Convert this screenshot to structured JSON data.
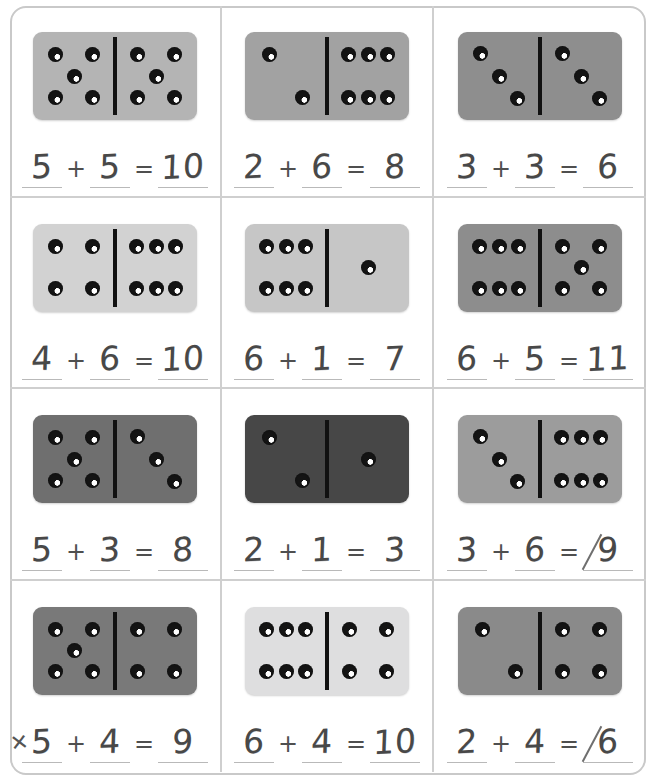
{
  "worksheet": {
    "title": "Domino Addition Worksheet",
    "columns": 3,
    "rows": 4,
    "frame_color": "#c9c9c9",
    "grid_line_color": "#cfcfcf",
    "pencil_color": "#484848",
    "pip_color": "#141414"
  },
  "problems": [
    {
      "id": "r1c1",
      "domino": {
        "left_pips": 5,
        "right_pips": 5,
        "tile_color": "#b4b4b4"
      },
      "equation": {
        "addend1": "5",
        "operator": "+",
        "addend2": "5",
        "equals": "=",
        "answer": "10"
      },
      "marks": {
        "crossed_out": "",
        "diagonal_slash": false,
        "answer_slash": false
      }
    },
    {
      "id": "r1c2",
      "domino": {
        "left_pips": 2,
        "right_pips": 6,
        "tile_color": "#a2a2a2"
      },
      "equation": {
        "addend1": "2",
        "operator": "+",
        "addend2": "6",
        "equals": "=",
        "answer": "8"
      },
      "marks": {
        "crossed_out": "",
        "diagonal_slash": false,
        "answer_slash": false
      }
    },
    {
      "id": "r1c3",
      "domino": {
        "left_pips": 3,
        "right_pips": 3,
        "tile_color": "#8e8e8e"
      },
      "equation": {
        "addend1": "3",
        "operator": "+",
        "addend2": "3",
        "equals": "=",
        "answer": "6"
      },
      "marks": {
        "crossed_out": "",
        "diagonal_slash": false,
        "answer_slash": false
      }
    },
    {
      "id": "r2c1",
      "domino": {
        "left_pips": 4,
        "right_pips": 6,
        "tile_color": "#d2d2d2"
      },
      "equation": {
        "addend1": "4",
        "operator": "+",
        "addend2": "6",
        "equals": "=",
        "answer": "10"
      },
      "marks": {
        "crossed_out": "",
        "diagonal_slash": false,
        "answer_slash": false
      }
    },
    {
      "id": "r2c2",
      "domino": {
        "left_pips": 6,
        "right_pips": 1,
        "tile_color": "#c6c6c6"
      },
      "equation": {
        "addend1": "6",
        "operator": "+",
        "addend2": "1",
        "equals": "=",
        "answer": "7"
      },
      "marks": {
        "crossed_out": "",
        "diagonal_slash": false,
        "answer_slash": false
      }
    },
    {
      "id": "r2c3",
      "domino": {
        "left_pips": 6,
        "right_pips": 5,
        "tile_color": "#8d8d8d"
      },
      "equation": {
        "addend1": "6",
        "operator": "+",
        "addend2": "5",
        "equals": "=",
        "answer": "11"
      },
      "marks": {
        "crossed_out": "",
        "diagonal_slash": false,
        "answer_slash": false
      }
    },
    {
      "id": "r3c1",
      "domino": {
        "left_pips": 5,
        "right_pips": 3,
        "tile_color": "#6f6f6f"
      },
      "equation": {
        "addend1": "5",
        "operator": "+",
        "addend2": "3",
        "equals": "=",
        "answer": "8"
      },
      "marks": {
        "crossed_out": "",
        "diagonal_slash": false,
        "answer_slash": false
      }
    },
    {
      "id": "r3c2",
      "domino": {
        "left_pips": 2,
        "right_pips": 1,
        "tile_color": "#474747"
      },
      "equation": {
        "addend1": "2",
        "operator": "+",
        "addend2": "1",
        "equals": "=",
        "answer": "3"
      },
      "marks": {
        "crossed_out": "",
        "diagonal_slash": false,
        "answer_slash": false
      }
    },
    {
      "id": "r3c3",
      "domino": {
        "left_pips": 3,
        "right_pips": 6,
        "tile_color": "#9c9c9c"
      },
      "equation": {
        "addend1": "3",
        "operator": "+",
        "addend2": "6",
        "equals": "=",
        "answer": "9"
      },
      "marks": {
        "crossed_out": "",
        "diagonal_slash": false,
        "answer_slash": true
      }
    },
    {
      "id": "r4c1",
      "domino": {
        "left_pips": 5,
        "right_pips": 4,
        "tile_color": "#797979"
      },
      "equation": {
        "addend1": "5",
        "operator": "+",
        "addend2": "4",
        "equals": "=",
        "answer": "9"
      },
      "marks": {
        "crossed_out": "4",
        "diagonal_slash": false,
        "answer_slash": false
      }
    },
    {
      "id": "r4c2",
      "domino": {
        "left_pips": 6,
        "right_pips": 4,
        "tile_color": "#dededf"
      },
      "equation": {
        "addend1": "6",
        "operator": "+",
        "addend2": "4",
        "equals": "=",
        "answer": "10"
      },
      "marks": {
        "crossed_out": "",
        "diagonal_slash": false,
        "answer_slash": false
      }
    },
    {
      "id": "r4c3",
      "domino": {
        "left_pips": 2,
        "right_pips": 4,
        "tile_color": "#8a8a8a"
      },
      "equation": {
        "addend1": "2",
        "operator": "+",
        "addend2": "4",
        "equals": "=",
        "answer": "6"
      },
      "marks": {
        "crossed_out": "",
        "diagonal_slash": true,
        "answer_slash": true
      }
    }
  ]
}
